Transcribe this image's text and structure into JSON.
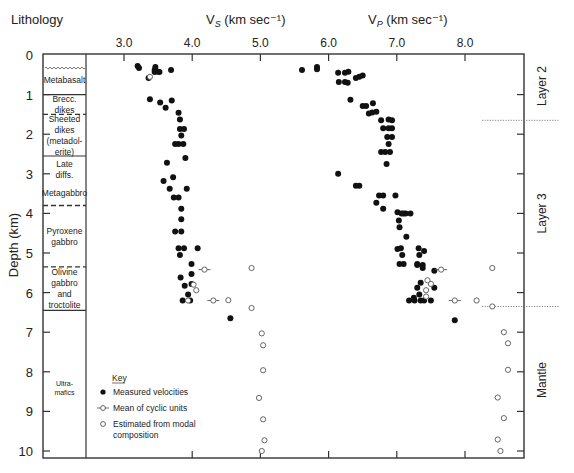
{
  "chart_data": {
    "type": "scatter",
    "title": "",
    "headers": {
      "lithology": "Lithology",
      "vs": "V_S (km sec⁻¹)",
      "vp": "V_P (km sec⁻¹)"
    },
    "ylabel": "Depth (km)",
    "ylim": [
      0,
      10
    ],
    "y_ticks": [
      0,
      1,
      2,
      3,
      4,
      5,
      6,
      7,
      8,
      9,
      10
    ],
    "x_top_ticks": [
      "3.0",
      "4.0",
      "5.0",
      "6.0",
      "7.0",
      "8.0"
    ],
    "x_top_tick_values": [
      3.0,
      4.0,
      5.0,
      6.0,
      7.0,
      8.0
    ],
    "x_bottom_tick_values": [
      4.0,
      5.0,
      6.0,
      7.0,
      8.0
    ],
    "grid": false,
    "lithology": [
      {
        "label": "Metabasalt",
        "top": 0.0,
        "bottom": 1.0,
        "top_boundary": "none"
      },
      {
        "label": "Brecc.\ndikes",
        "top": 1.0,
        "bottom": 1.5,
        "top_boundary": "solid"
      },
      {
        "label": "Sheeted\ndikes\n(metadol-\nerite)",
        "top": 1.5,
        "bottom": 2.55,
        "top_boundary": "dashed"
      },
      {
        "label": "Late\ndiffs.",
        "top": 2.55,
        "bottom": 3.2,
        "top_boundary": "solid"
      },
      {
        "label": "Metagabbro",
        "top": 3.2,
        "bottom": 3.8,
        "top_boundary": "none"
      },
      {
        "label": "Pyroxene\ngabbro",
        "top": 3.8,
        "bottom": 5.35,
        "top_boundary": "dashed"
      },
      {
        "label": "Olivine\ngabbro\nand\ntroctolite",
        "top": 5.35,
        "bottom": 6.45,
        "top_boundary": "dashed"
      },
      {
        "label": "Ultra-\nmafics",
        "top": 6.45,
        "bottom": 10.2,
        "top_boundary": "solid"
      }
    ],
    "wavy_line_depth": 0.33,
    "layers": [
      {
        "label": "Layer 2",
        "top": 0.0,
        "bottom": 1.65
      },
      {
        "label": "Layer 3",
        "top": 1.65,
        "bottom": 6.35
      },
      {
        "label": "Mantle",
        "top": 6.35,
        "bottom": 10.2
      }
    ],
    "layer_boundaries": [
      1.65,
      6.35
    ],
    "legend": {
      "title": "Key",
      "entries": [
        {
          "marker": "filled",
          "label": "Measured velocities"
        },
        {
          "marker": "bar",
          "label": "Mean of cyclic units"
        },
        {
          "marker": "open",
          "label": "Estimated from modal\ncomposition"
        }
      ],
      "position": "lower-left"
    },
    "series": [
      {
        "name": "Vs measured",
        "marker": "filled",
        "points": [
          [
            3.2,
            0.28
          ],
          [
            3.22,
            0.33
          ],
          [
            3.46,
            0.3
          ],
          [
            3.45,
            0.38
          ],
          [
            3.52,
            0.43
          ],
          [
            3.45,
            0.43
          ],
          [
            3.5,
            0.42
          ],
          [
            3.69,
            0.38
          ],
          [
            3.36,
            0.58
          ],
          [
            3.38,
            1.12
          ],
          [
            3.53,
            1.2
          ],
          [
            3.7,
            1.15
          ],
          [
            3.61,
            1.33
          ],
          [
            3.8,
            1.46
          ],
          [
            3.82,
            1.63
          ],
          [
            3.82,
            1.87
          ],
          [
            3.88,
            1.87
          ],
          [
            3.84,
            2.03
          ],
          [
            3.75,
            2.25
          ],
          [
            3.8,
            2.25
          ],
          [
            3.87,
            2.25
          ],
          [
            3.9,
            2.6
          ],
          [
            3.63,
            2.72
          ],
          [
            3.58,
            3.18
          ],
          [
            3.72,
            3.09
          ],
          [
            3.67,
            3.38
          ],
          [
            3.92,
            3.38
          ],
          [
            3.73,
            3.6
          ],
          [
            3.8,
            3.6
          ],
          [
            3.84,
            3.88
          ],
          [
            3.84,
            4.15
          ],
          [
            3.75,
            4.46
          ],
          [
            3.84,
            4.46
          ],
          [
            3.8,
            4.88
          ],
          [
            4.08,
            4.88
          ],
          [
            3.88,
            4.88
          ],
          [
            3.82,
            5.05
          ],
          [
            3.99,
            5.28
          ],
          [
            3.83,
            5.62
          ],
          [
            3.99,
            5.53
          ],
          [
            3.99,
            5.78
          ],
          [
            3.89,
            5.83
          ],
          [
            3.86,
            6.2
          ],
          [
            3.94,
            6.05
          ],
          [
            3.97,
            6.2
          ],
          [
            4.56,
            6.65
          ]
        ]
      },
      {
        "name": "Vs mean of cyclic units",
        "marker": "bar",
        "points": [
          [
            4.18,
            5.42
          ],
          [
            4.31,
            6.2
          ]
        ]
      },
      {
        "name": "Vs estimated",
        "marker": "open",
        "points": [
          [
            3.38,
            0.55
          ],
          [
            4.02,
            5.8
          ],
          [
            4.06,
            5.94
          ],
          [
            3.94,
            6.2
          ],
          [
            4.87,
            5.38
          ],
          [
            4.53,
            6.19
          ],
          [
            4.87,
            6.39
          ],
          [
            5.02,
            7.03
          ],
          [
            5.04,
            7.33
          ],
          [
            5.04,
            7.96
          ],
          [
            4.98,
            8.66
          ],
          [
            5.04,
            9.2
          ],
          [
            5.06,
            9.73
          ],
          [
            5.02,
            10.0
          ]
        ]
      },
      {
        "name": "Vp measured",
        "marker": "filled",
        "points": [
          [
            5.61,
            0.38
          ],
          [
            5.83,
            0.3
          ],
          [
            5.83,
            0.36
          ],
          [
            6.14,
            0.45
          ],
          [
            6.24,
            0.45
          ],
          [
            6.29,
            0.42
          ],
          [
            6.4,
            0.58
          ],
          [
            6.45,
            0.55
          ],
          [
            6.5,
            0.52
          ],
          [
            6.15,
            0.68
          ],
          [
            6.24,
            0.68
          ],
          [
            6.28,
            0.7
          ],
          [
            6.32,
            1.13
          ],
          [
            6.5,
            1.29
          ],
          [
            6.55,
            1.29
          ],
          [
            6.65,
            1.22
          ],
          [
            6.59,
            1.48
          ],
          [
            6.64,
            1.45
          ],
          [
            6.7,
            1.43
          ],
          [
            6.77,
            1.65
          ],
          [
            6.88,
            1.63
          ],
          [
            6.93,
            1.65
          ],
          [
            6.8,
            1.85
          ],
          [
            6.88,
            1.85
          ],
          [
            6.93,
            1.85
          ],
          [
            6.86,
            2.07
          ],
          [
            6.93,
            2.07
          ],
          [
            6.88,
            2.25
          ],
          [
            6.77,
            2.45
          ],
          [
            6.83,
            2.45
          ],
          [
            6.9,
            2.45
          ],
          [
            6.85,
            2.75
          ],
          [
            6.14,
            3.0
          ],
          [
            6.4,
            3.3
          ],
          [
            6.45,
            3.3
          ],
          [
            6.74,
            3.55
          ],
          [
            6.8,
            3.55
          ],
          [
            6.98,
            3.55
          ],
          [
            6.7,
            3.73
          ],
          [
            6.8,
            3.88
          ],
          [
            7.01,
            3.97
          ],
          [
            7.07,
            4.0
          ],
          [
            7.13,
            4.0
          ],
          [
            7.03,
            4.18
          ],
          [
            7.1,
            4.0
          ],
          [
            7.2,
            4.0
          ],
          [
            7.04,
            4.35
          ],
          [
            7.14,
            4.59
          ],
          [
            7.01,
            4.9
          ],
          [
            7.06,
            4.88
          ],
          [
            7.08,
            5.05
          ],
          [
            7.32,
            4.88
          ],
          [
            7.33,
            5.05
          ],
          [
            7.4,
            4.95
          ],
          [
            7.04,
            5.28
          ],
          [
            7.1,
            5.28
          ],
          [
            7.3,
            5.28
          ],
          [
            7.3,
            5.3
          ],
          [
            7.38,
            5.3
          ],
          [
            7.38,
            5.38
          ],
          [
            7.55,
            5.45
          ],
          [
            7.35,
            5.75
          ],
          [
            7.3,
            5.88
          ],
          [
            7.55,
            5.88
          ],
          [
            7.33,
            6.05
          ],
          [
            7.26,
            6.2
          ],
          [
            7.35,
            6.2
          ],
          [
            7.4,
            6.2
          ],
          [
            7.18,
            6.2
          ],
          [
            7.25,
            6.13
          ],
          [
            7.5,
            6.2
          ],
          [
            7.85,
            6.7
          ]
        ]
      },
      {
        "name": "Vp mean of cyclic units",
        "marker": "bar",
        "points": [
          [
            7.65,
            5.42
          ],
          [
            7.85,
            6.2
          ]
        ]
      },
      {
        "name": "Vp estimated",
        "marker": "open",
        "points": [
          [
            7.45,
            5.69
          ],
          [
            7.5,
            5.78
          ],
          [
            7.43,
            5.94
          ],
          [
            7.43,
            6.1
          ],
          [
            8.17,
            6.2
          ],
          [
            8.4,
            5.38
          ],
          [
            8.4,
            6.35
          ],
          [
            8.57,
            7.0
          ],
          [
            8.63,
            7.28
          ],
          [
            8.63,
            7.95
          ],
          [
            8.48,
            8.65
          ],
          [
            8.57,
            9.17
          ],
          [
            8.48,
            9.71
          ],
          [
            8.52,
            10.0
          ]
        ]
      }
    ]
  }
}
